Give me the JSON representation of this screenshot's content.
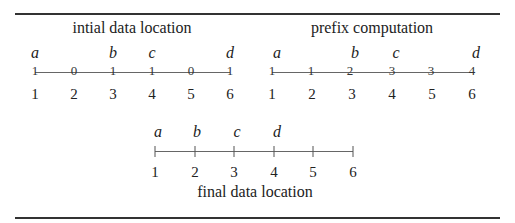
{
  "figure": {
    "panels": [
      {
        "title": "intial data location",
        "positions": [
          "1",
          "2",
          "3",
          "4",
          "5",
          "6"
        ],
        "labels": [
          "a",
          "",
          "b",
          "c",
          "",
          "d"
        ],
        "values": [
          "1",
          "0",
          "1",
          "1",
          "0",
          "1"
        ]
      },
      {
        "title": "prefix computation",
        "positions": [
          "1",
          "2",
          "3",
          "4",
          "5",
          "6"
        ],
        "labels": [
          "a",
          "",
          "b",
          "c",
          "",
          "d"
        ],
        "values": [
          "1",
          "1",
          "2",
          "3",
          "3",
          "4"
        ]
      },
      {
        "title": "final data location",
        "positions": [
          "1",
          "2",
          "3",
          "4",
          "5",
          "6"
        ],
        "labels": [
          "a",
          "b",
          "c",
          "d",
          "",
          ""
        ],
        "values": [
          "",
          "",
          "",
          "",
          "",
          ""
        ]
      }
    ]
  }
}
